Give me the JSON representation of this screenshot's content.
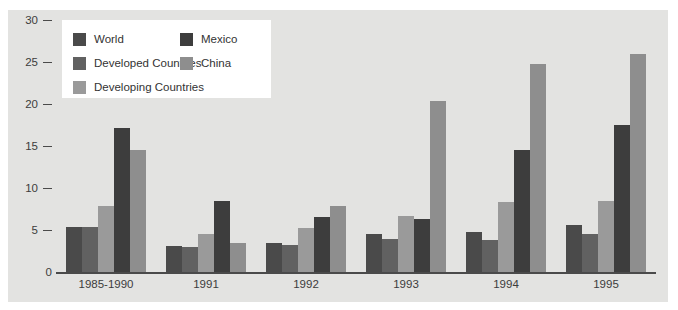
{
  "chart_data": {
    "type": "bar",
    "title": "",
    "xlabel": "",
    "ylabel": "",
    "ylim": [
      0,
      30
    ],
    "yticks": [
      0,
      5,
      10,
      15,
      20,
      25,
      30
    ],
    "grid": false,
    "legend_position": "top-left-inside",
    "categories": [
      "1985-1990",
      "1991",
      "1992",
      "1993",
      "1994",
      "1995"
    ],
    "series": [
      {
        "name": "World",
        "color": "#4a4a4a",
        "values": [
          5.4,
          3.1,
          3.5,
          4.5,
          4.8,
          5.6
        ]
      },
      {
        "name": "Developed Countries",
        "color": "#616161",
        "values": [
          5.4,
          3.0,
          3.2,
          3.9,
          3.8,
          4.5
        ]
      },
      {
        "name": "Developing Countries",
        "color": "#9a9a9a",
        "values": [
          7.9,
          4.5,
          5.2,
          6.7,
          8.3,
          8.5
        ]
      },
      {
        "name": "Mexico",
        "color": "#3d3d3d",
        "values": [
          17.1,
          8.5,
          6.5,
          6.3,
          14.5,
          17.5
        ]
      },
      {
        "name": "China",
        "color": "#8e8e8e",
        "values": [
          14.5,
          3.4,
          7.8,
          20.4,
          24.8,
          26.0
        ]
      }
    ]
  },
  "legend": {
    "left_column": [
      {
        "label": "World",
        "color": "#4a4a4a",
        "swatch_name": "legend-swatch-world"
      },
      {
        "label": "Developed Countries",
        "color": "#616161",
        "swatch_name": "legend-swatch-developed-countries"
      },
      {
        "label": "Developing Countries",
        "color": "#9a9a9a",
        "swatch_name": "legend-swatch-developing-countries"
      }
    ],
    "right_column": [
      {
        "label": "Mexico",
        "color": "#3d3d3d",
        "swatch_name": "legend-swatch-mexico"
      },
      {
        "label": "China",
        "color": "#8e8e8e",
        "swatch_name": "legend-swatch-china"
      }
    ]
  },
  "colors": {
    "canvas_background": "#e3e3e1",
    "page_background": "#ffffff",
    "axis": "#4a4a4a",
    "tick_text": "#3c3c3c",
    "legend_background": "#ffffff"
  }
}
